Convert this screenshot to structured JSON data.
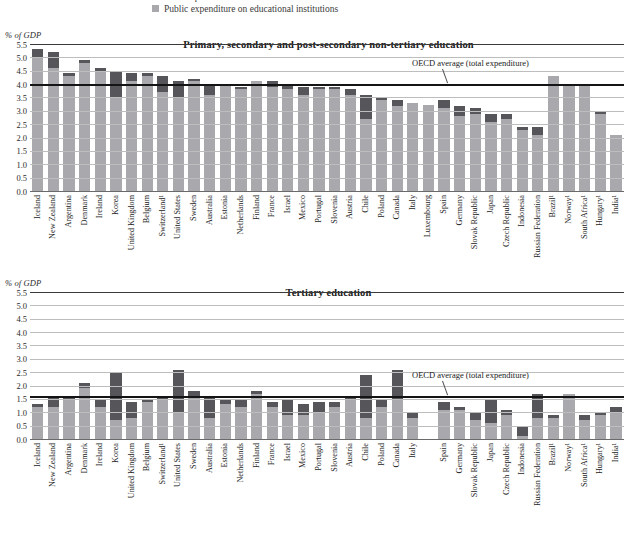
{
  "legend": {
    "items": [
      {
        "label": "Total expenditure on educational institutions",
        "color": "#56565a"
      },
      {
        "label": "Public expenditure on educational institutions",
        "color": "#a9a9ad"
      }
    ]
  },
  "axis_unit_label": "% of GDP",
  "yticks": [
    "5.5",
    "5.0",
    "4.5",
    "4.0",
    "3.5",
    "3.0",
    "2.5",
    "2.0",
    "1.5",
    "1.0",
    "0.5",
    "0.0"
  ],
  "annotation_label": "OECD average (total expenditure)",
  "colors": {
    "total": "#56565a",
    "public": "#a9a9ad",
    "average_line": "#141414",
    "gridline": "#bdbdbd"
  },
  "chart_data": [
    {
      "type": "bar",
      "title": "Primary, secondary and post-secondary non-tertiary education",
      "xlabel": "",
      "ylabel": "% of GDP",
      "ylim": [
        0.0,
        5.5
      ],
      "ytick_step": 0.5,
      "grid": true,
      "stacked": true,
      "legend_position": "top",
      "oecd_average_total": 4.0,
      "annotation": "OECD average (total expenditure)",
      "categories": [
        "Iceland",
        "New Zealand",
        "Argentina",
        "Denmark",
        "Ireland",
        "Korea",
        "United Kingdom",
        "Belgium",
        "Switzerland¹",
        "United States",
        "Sweden",
        "Australia",
        "Estonia",
        "Netherlands",
        "Finland",
        "France",
        "Israel",
        "Mexico",
        "Portugal",
        "Slovenia",
        "Austria",
        "Chile",
        "Poland",
        "Canada",
        "Italy",
        "Luxembourg",
        "Spain",
        "Germany",
        "Slovak Republic",
        "Japan",
        "Czech Republic",
        "Indonesia",
        "Russian Federation",
        "Brazil¹",
        "Norway¹",
        "South Africa¹",
        "Hungary¹",
        "India¹"
      ],
      "series": [
        {
          "name": "Public expenditure on educational institutions",
          "values": [
            5.0,
            4.6,
            4.3,
            4.8,
            4.5,
            3.5,
            4.1,
            4.3,
            3.7,
            3.5,
            4.1,
            3.6,
            4.0,
            3.8,
            4.1,
            3.9,
            3.8,
            3.6,
            3.8,
            3.8,
            3.6,
            2.7,
            3.4,
            3.2,
            3.3,
            3.2,
            3.1,
            2.8,
            2.9,
            2.6,
            2.7,
            2.3,
            2.1,
            4.3,
            4.0,
            4.0,
            2.9,
            2.1
          ]
        },
        {
          "name": "Private expenditure share (stacked to total)",
          "values": [
            0.3,
            0.6,
            0.1,
            0.1,
            0.1,
            1.0,
            0.3,
            0.1,
            0.6,
            0.6,
            0.1,
            0.4,
            0.0,
            0.1,
            0.0,
            0.2,
            0.2,
            0.3,
            0.1,
            0.1,
            0.2,
            0.9,
            0.1,
            0.2,
            0.0,
            0.0,
            0.3,
            0.4,
            0.2,
            0.3,
            0.2,
            0.1,
            0.3,
            0.0,
            0.0,
            0.0,
            0.1,
            0.0
          ]
        }
      ],
      "totals": [
        5.3,
        5.2,
        4.4,
        4.9,
        4.6,
        4.5,
        4.4,
        4.4,
        4.3,
        4.1,
        4.2,
        4.0,
        4.0,
        3.9,
        4.1,
        4.1,
        4.0,
        3.9,
        3.9,
        3.9,
        3.8,
        3.6,
        3.5,
        3.4,
        3.3,
        3.2,
        3.4,
        3.2,
        3.1,
        2.9,
        2.9,
        2.4,
        2.4,
        4.3,
        4.0,
        4.0,
        3.0,
        2.1
      ]
    },
    {
      "type": "bar",
      "title": "Tertiary education",
      "xlabel": "",
      "ylabel": "% of GDP",
      "ylim": [
        0.0,
        5.5
      ],
      "ytick_step": 0.5,
      "grid": true,
      "stacked": true,
      "legend_position": "top",
      "oecd_average_total": 1.6,
      "annotation": "OECD average (total expenditure)",
      "categories": [
        "Iceland",
        "New Zealand",
        "Argentina",
        "Denmark",
        "Ireland",
        "Korea",
        "United Kingdom",
        "Belgium",
        "Switzerland¹",
        "United States",
        "Sweden",
        "Australia",
        "Estonia",
        "Netherlands",
        "Finland",
        "France",
        "Israel",
        "Mexico",
        "Portugal",
        "Slovenia",
        "Austria",
        "Chile",
        "Poland",
        "Canada",
        "Italy",
        "",
        "Spain",
        "Germany",
        "Slovak Republic",
        "Japan",
        "Czech Republic",
        "Indonesia",
        "Russian Federation",
        "Brazil¹",
        "Norway¹",
        "South Africa¹",
        "Hungary¹",
        "India¹"
      ],
      "series": [
        {
          "name": "Public expenditure on educational institutions",
          "values": [
            1.2,
            1.2,
            1.5,
            1.9,
            1.2,
            0.7,
            0.8,
            1.4,
            1.5,
            1.0,
            1.6,
            0.8,
            1.3,
            1.2,
            1.7,
            1.2,
            0.9,
            0.9,
            1.0,
            1.2,
            1.5,
            0.8,
            1.2,
            1.5,
            0.8,
            0.0,
            1.1,
            1.1,
            0.7,
            0.6,
            0.9,
            0.1,
            0.8,
            0.8,
            1.7,
            0.7,
            0.9,
            1.0
          ]
        },
        {
          "name": "Private expenditure share (stacked to total)",
          "values": [
            0.1,
            0.4,
            0.1,
            0.2,
            0.3,
            1.8,
            0.6,
            0.1,
            0.1,
            1.6,
            0.2,
            0.8,
            0.2,
            0.3,
            0.1,
            0.2,
            0.6,
            0.4,
            0.4,
            0.2,
            0.1,
            1.6,
            0.3,
            1.1,
            0.2,
            0.0,
            0.3,
            0.1,
            0.3,
            0.9,
            0.2,
            0.4,
            0.9,
            0.1,
            0.0,
            0.2,
            0.1,
            0.2
          ]
        }
      ],
      "totals": [
        1.3,
        1.6,
        1.6,
        2.1,
        1.5,
        2.5,
        1.4,
        1.5,
        1.6,
        2.6,
        1.8,
        1.6,
        1.5,
        1.5,
        1.8,
        1.4,
        1.5,
        1.3,
        1.4,
        1.4,
        1.6,
        2.4,
        1.5,
        2.6,
        1.0,
        0.0,
        1.4,
        1.2,
        1.0,
        1.5,
        1.1,
        0.5,
        1.7,
        0.9,
        1.7,
        0.9,
        1.0,
        1.2
      ]
    }
  ]
}
